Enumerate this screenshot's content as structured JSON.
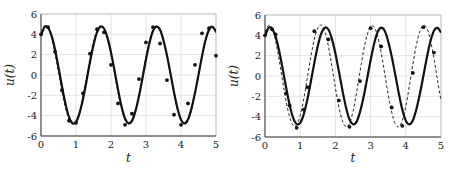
{
  "chart_data": [
    {
      "type": "line",
      "panel": "left",
      "title": "",
      "xlabel": "t",
      "ylabel": "u(t)",
      "xlim": [
        0,
        5
      ],
      "ylim": [
        -6,
        6
      ],
      "xticks": [
        0,
        1,
        2,
        3,
        4,
        5
      ],
      "yticks": [
        -6,
        -4,
        -2,
        0,
        2,
        4,
        6
      ],
      "grid": true,
      "legend": null,
      "x": [
        0,
        0.1,
        0.2,
        0.3,
        0.4,
        0.5,
        0.6,
        0.7,
        0.8,
        0.9,
        1.0,
        1.1,
        1.2,
        1.3,
        1.4,
        1.5,
        1.6,
        1.7,
        1.8,
        1.9,
        2.0,
        2.1,
        2.2,
        2.3,
        2.4,
        2.5,
        2.6,
        2.7,
        2.8,
        2.9,
        3.0,
        3.1,
        3.2,
        3.3,
        3.4,
        3.5,
        3.6,
        3.7,
        3.8,
        3.9,
        4.0,
        4.1,
        4.2,
        4.3,
        4.4,
        4.5,
        4.6,
        4.7,
        4.8,
        4.9,
        5.0
      ],
      "series": [
        {
          "name": "solid",
          "style": "solid",
          "values": [
            3.91,
            4.73,
            4.66,
            3.89,
            2.5,
            0.73,
            -1.13,
            -2.84,
            -4.13,
            -4.74,
            -4.62,
            -3.77,
            -2.37,
            -0.59,
            1.27,
            2.96,
            4.2,
            4.75,
            4.57,
            3.65,
            2.22,
            0.44,
            -1.41,
            -3.07,
            -4.27,
            -4.75,
            -4.51,
            -3.53,
            -2.07,
            -0.29,
            1.55,
            3.18,
            4.33,
            4.75,
            4.44,
            3.4,
            1.91,
            0.14,
            -1.69,
            -3.29,
            -4.39,
            -4.75,
            -4.37,
            -3.27,
            -1.75,
            0.01,
            1.84,
            3.41,
            4.45,
            4.73,
            4.28
          ]
        },
        {
          "name": "dashed",
          "style": "dashed",
          "values": [
            4.16,
            4.8,
            4.62,
            3.68,
            2.14,
            0.27,
            -1.63,
            -3.25,
            -4.37,
            -4.84,
            -4.58,
            -3.64,
            -2.1,
            -0.23,
            1.67,
            3.28,
            4.39,
            4.85,
            4.57,
            3.59,
            2.05,
            0.18,
            -1.72,
            -3.31,
            -4.4,
            -4.85,
            -4.55,
            -3.55,
            -2.0,
            -0.13,
            1.76,
            3.35,
            4.42,
            4.84,
            4.53,
            3.51,
            1.96,
            0.09,
            -1.8,
            -3.38,
            -4.44,
            -4.84,
            -4.51,
            -3.47,
            -1.91,
            -0.04,
            1.85,
            3.41,
            4.46,
            4.83,
            4.12
          ]
        }
      ],
      "points": {
        "name": "data",
        "x": [
          0.0,
          0.2,
          0.4,
          0.6,
          0.8,
          1.0,
          1.2,
          1.4,
          1.6,
          1.8,
          2.0,
          2.2,
          2.4,
          2.6,
          2.8,
          3.0,
          3.2,
          3.4,
          3.6,
          3.8,
          4.0,
          4.2,
          4.4,
          4.6,
          4.8,
          5.0
        ],
        "y": [
          4.0,
          4.7,
          2.3,
          -1.5,
          -4.5,
          -4.7,
          -1.8,
          2.1,
          4.5,
          4.2,
          1.0,
          -2.8,
          -4.9,
          -3.8,
          -0.4,
          3.2,
          4.7,
          3.1,
          -0.5,
          -3.9,
          -4.9,
          -2.8,
          1.0,
          4.1,
          4.6,
          1.9
        ]
      }
    },
    {
      "type": "line",
      "panel": "right",
      "title": "",
      "xlabel": "t",
      "ylabel": "u(t)",
      "xlim": [
        0,
        5
      ],
      "ylim": [
        -6,
        6
      ],
      "xticks": [
        0,
        1,
        2,
        3,
        4,
        5
      ],
      "yticks": [
        -6,
        -4,
        -2,
        0,
        2,
        4,
        6
      ],
      "grid": true,
      "legend": null,
      "x": [
        0,
        0.1,
        0.2,
        0.3,
        0.4,
        0.5,
        0.6,
        0.7,
        0.8,
        0.9,
        1.0,
        1.1,
        1.2,
        1.3,
        1.4,
        1.5,
        1.6,
        1.7,
        1.8,
        1.9,
        2.0,
        2.1,
        2.2,
        2.3,
        2.4,
        2.5,
        2.6,
        2.7,
        2.8,
        2.9,
        3.0,
        3.1,
        3.2,
        3.3,
        3.4,
        3.5,
        3.6,
        3.7,
        3.8,
        3.9,
        4.0,
        4.1,
        4.2,
        4.3,
        4.4,
        4.5,
        4.6,
        4.7,
        4.8,
        4.9,
        5.0
      ],
      "series": [
        {
          "name": "solid",
          "style": "solid",
          "values": [
            3.91,
            4.73,
            4.66,
            3.89,
            2.5,
            0.73,
            -1.13,
            -2.84,
            -4.13,
            -4.74,
            -4.62,
            -3.77,
            -2.37,
            -0.59,
            1.27,
            2.96,
            4.2,
            4.75,
            4.57,
            3.65,
            2.22,
            0.44,
            -1.41,
            -3.07,
            -4.27,
            -4.75,
            -4.51,
            -3.53,
            -2.07,
            -0.29,
            1.55,
            3.18,
            4.33,
            4.75,
            4.44,
            3.4,
            1.91,
            0.14,
            -1.69,
            -3.29,
            -4.39,
            -4.75,
            -4.37,
            -3.27,
            -1.75,
            0.01,
            1.84,
            3.41,
            4.45,
            4.73,
            4.28
          ]
        },
        {
          "name": "dashed",
          "style": "dashed",
          "values": [
            4.34,
            4.98,
            4.67,
            3.47,
            1.63,
            -0.48,
            -2.49,
            -4.03,
            -4.85,
            -4.8,
            -3.89,
            -2.27,
            -0.24,
            1.84,
            3.59,
            4.72,
            5.0,
            4.38,
            2.96,
            0.98,
            -1.17,
            -3.07,
            -4.43,
            -4.99,
            -4.67,
            -3.5,
            -1.67,
            0.44,
            2.46,
            4.01,
            4.85,
            4.81,
            3.91,
            2.3,
            0.28,
            -1.81,
            -3.57,
            -4.71,
            -5.0,
            -4.4,
            -2.99,
            -1.02,
            1.13,
            3.04,
            4.41,
            4.99,
            4.68,
            3.53,
            1.72,
            -0.39,
            -2.42
          ]
        }
      ],
      "points": {
        "name": "data",
        "x": [
          0.0,
          0.2,
          0.3,
          0.6,
          0.7,
          0.9,
          1.1,
          1.2,
          1.4,
          1.8,
          2.1,
          2.4,
          2.7,
          3.0,
          3.3,
          3.6,
          3.9,
          4.2,
          4.5,
          4.8
        ],
        "y": [
          4.0,
          4.6,
          4.1,
          -1.7,
          -2.9,
          -5.1,
          -3.3,
          -1.1,
          4.4,
          3.6,
          -2.4,
          -5.0,
          -0.5,
          4.7,
          2.9,
          -3.1,
          -4.9,
          0.3,
          4.8,
          2.3
        ]
      }
    }
  ]
}
